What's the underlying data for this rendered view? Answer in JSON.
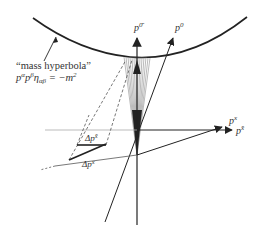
{
  "diagram": {
    "title_label": "“mass hyperbola”",
    "equation_label": "pᵅpᵝu03B7ₐᵦ = −m²",
    "equation_parts": {
      "p": "p",
      "alpha": "α",
      "beta": "β",
      "eta": "η",
      "eq": " = −m",
      "sq": "2"
    },
    "axes": {
      "p0": {
        "base": "p",
        "sup": "0"
      },
      "p0bar": {
        "base": "p",
        "sup": "0̄"
      },
      "px": {
        "base": "p",
        "sup": "x"
      },
      "pxbar": {
        "base": "p",
        "sup": "x̄"
      }
    },
    "deltas": {
      "dpxbar": {
        "base": "Δp",
        "sup": "x̄"
      },
      "dpx": {
        "base": "Δp",
        "sup": "x"
      }
    },
    "colors": {
      "ink": "#222222",
      "hatch": "#777777",
      "dashed": "#555555"
    }
  }
}
